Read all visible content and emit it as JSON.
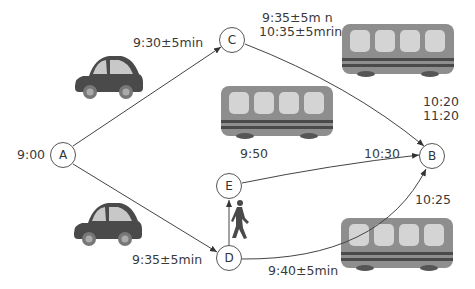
{
  "diagram": {
    "type": "route-network",
    "nodes": [
      {
        "id": "A",
        "label": "A",
        "time": "9:00"
      },
      {
        "id": "B",
        "label": "B",
        "times": [
          "10:20",
          "11:20"
        ]
      },
      {
        "id": "C",
        "label": "C"
      },
      {
        "id": "D",
        "label": "D"
      },
      {
        "id": "E",
        "label": "E"
      }
    ],
    "edges": [
      {
        "from": "A",
        "to": "C",
        "mode": "car",
        "label": "9:30±5min"
      },
      {
        "from": "A",
        "to": "D",
        "mode": "car",
        "label": "9:35±5min"
      },
      {
        "from": "C",
        "to": "B",
        "mode": "bus",
        "label_lines": [
          "9:35±5m n",
          "10:35±5mrin"
        ]
      },
      {
        "from": "E",
        "to": "B",
        "mode": "bus",
        "label_start": "9:50",
        "label_end": "10:30"
      },
      {
        "from": "D",
        "to": "E",
        "mode": "walk"
      },
      {
        "from": "D",
        "to": "B",
        "mode": "bus",
        "label_start": "9:40±5min",
        "label_end": "10:25"
      }
    ],
    "labels": {
      "a_time": "9:00",
      "ac_time": "9:30±5min",
      "ad_time": "9:35±5min",
      "cb_line1": "9:35±5m n",
      "cb_line2": "10:35±5mrin",
      "b_line1": "10:20",
      "b_line2": "11:20",
      "eb_start": "9:50",
      "eb_end": "10:30",
      "db_start": "9:40±5min",
      "db_end": "10:25"
    },
    "icons": [
      "car-icon",
      "car-icon",
      "bus-icon",
      "bus-icon",
      "bus-icon",
      "pedestrian-icon"
    ],
    "colors": {
      "car_body": "#4a4a4a",
      "car_window": "#c8c8c8",
      "bus_body": "#8c8c8c",
      "bus_window": "#d2d2d2",
      "bus_stripe": "#4a4a4a",
      "line": "#444444"
    }
  }
}
